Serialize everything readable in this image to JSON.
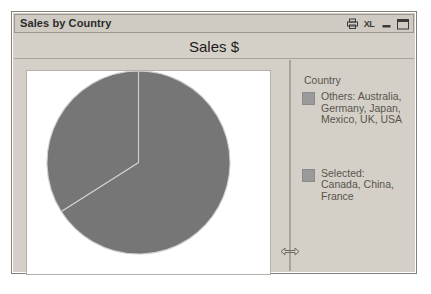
{
  "window": {
    "title": "Sales by Country",
    "titlebar_buttons": [
      {
        "name": "print-icon",
        "label": ""
      },
      {
        "name": "excel-export-icon",
        "label": "XL"
      },
      {
        "name": "minimize-icon",
        "label": ""
      },
      {
        "name": "maximize-icon",
        "label": ""
      }
    ]
  },
  "header": {
    "measure_title": "Sales $"
  },
  "legend": {
    "title": "Country",
    "entries": [
      {
        "label": "Others: Australia,\nGermany, Japan,\nMexico, UK, USA",
        "color": "#9a9a9a"
      },
      {
        "label": "Selected:\nCanada, China,\nFrance",
        "color": "#9a9a9a"
      }
    ]
  },
  "splitter": {
    "grip_icon": "horizontal-resize-arrows"
  },
  "chart_data": {
    "type": "pie",
    "title": "Sales $",
    "legend_title": "Country",
    "legend_position": "right",
    "categories": [
      "Others: Australia, Germany, Japan, Mexico, UK, USA",
      "Selected: Canada, China, France"
    ],
    "values": [
      66,
      34
    ],
    "unit": "percent",
    "slice_colors": [
      "#9a9a9a",
      "#9a9a9a"
    ],
    "start_angle_deg": 0,
    "direction": "clockwise",
    "xlabel": "",
    "ylabel": "",
    "grid": false
  }
}
